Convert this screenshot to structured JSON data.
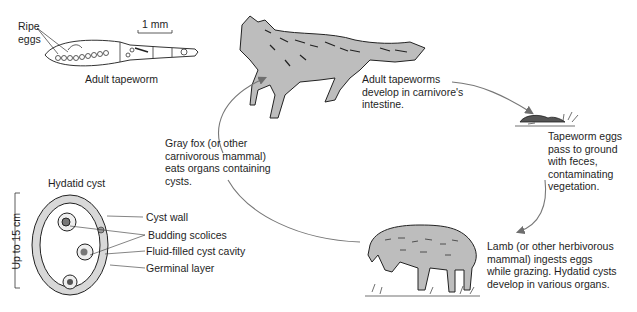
{
  "diagram": {
    "tapeworm": {
      "ripe_eggs_line1": "Ripe",
      "ripe_eggs_line2": "eggs",
      "scale": "1 mm",
      "caption": "Adult tapeworm"
    },
    "fox": {
      "caption_line1": "Adult tapeworms",
      "caption_line2": "develop in carnivore's",
      "caption_line3": "intestine."
    },
    "eggs": {
      "line1": "Tapeworm eggs",
      "line2": "pass to ground",
      "line3": "with feces,",
      "line4": "contaminating",
      "line5": "vegetation."
    },
    "lamb": {
      "line1": "Lamb (or other herbivorous",
      "line2": "mammal) ingests eggs",
      "line3": "while grazing. Hydatid cysts",
      "line4": "develop in various organs."
    },
    "graycarnivore": {
      "line1": "Gray fox (or other",
      "line2": "carnivorous mammal)",
      "line3": "eats organs containing",
      "line4": "cysts."
    },
    "cyst": {
      "title": "Hydatid cyst",
      "size": "Up to 15 cm",
      "labels": [
        "Cyst wall",
        "Budding scolices",
        "Fluid-filled cyst cavity",
        "Germinal layer"
      ]
    },
    "colors": {
      "animal_fill": "#bdbdbd",
      "arrow": "#777777",
      "ink": "#222222"
    }
  }
}
